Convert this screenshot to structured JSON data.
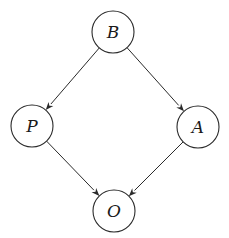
{
  "diagram": {
    "type": "directed-graph",
    "colors": {
      "stroke": "#2a2a2a",
      "fill": "#ffffff",
      "text": "#1a1a1a"
    },
    "nodes": [
      {
        "id": "B",
        "label": "B",
        "cx": 113,
        "cy": 32,
        "r": 21
      },
      {
        "id": "P",
        "label": "P",
        "cx": 32,
        "cy": 126,
        "r": 21
      },
      {
        "id": "A",
        "label": "A",
        "cx": 198,
        "cy": 127,
        "r": 21
      },
      {
        "id": "O",
        "label": "O",
        "cx": 114,
        "cy": 211,
        "r": 21
      }
    ],
    "edges": [
      {
        "from": "B",
        "to": "P"
      },
      {
        "from": "B",
        "to": "A"
      },
      {
        "from": "P",
        "to": "O"
      },
      {
        "from": "A",
        "to": "O"
      }
    ]
  }
}
